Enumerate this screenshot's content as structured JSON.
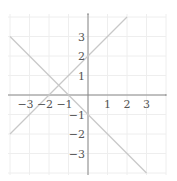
{
  "chart_data": {
    "type": "line",
    "title": "",
    "xlabel": "",
    "ylabel": "",
    "xlim": [
      -4,
      4
    ],
    "ylim": [
      -4,
      4
    ],
    "grid": true,
    "x_ticks": [
      -3,
      -2,
      -1,
      1,
      2,
      3
    ],
    "y_ticks": [
      3,
      2,
      1,
      -1,
      -2,
      -3
    ],
    "x_tick_labels": [
      "−3",
      "−2",
      "−1",
      "1",
      "2",
      "3"
    ],
    "y_tick_labels": [
      "3",
      "2",
      "1",
      "−1",
      "−2",
      "−3"
    ],
    "series": [
      {
        "name": "y = x + 2",
        "x": [
          -4,
          2
        ],
        "y": [
          -2,
          4
        ],
        "color": "#c8c8c8"
      },
      {
        "name": "y = -x - 1",
        "x": [
          -4,
          3
        ],
        "y": [
          3,
          -4
        ],
        "color": "#c8c8c8"
      }
    ],
    "intersection": {
      "x": -1.5,
      "y": 0.5
    }
  },
  "colors": {
    "axis": "#888888",
    "grid": "#eeeeee",
    "line": "#c8c8c8",
    "label": "#555555"
  }
}
